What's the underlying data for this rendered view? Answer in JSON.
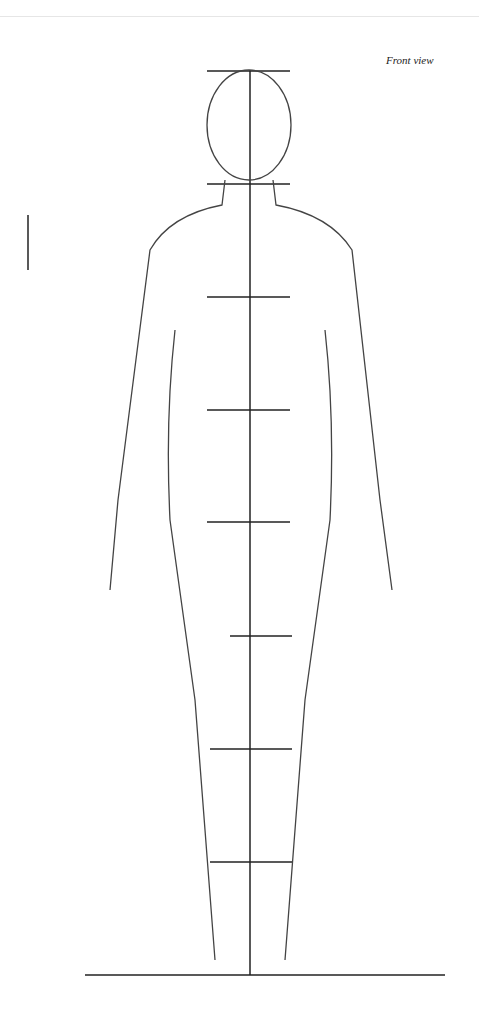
{
  "caption": "Front view",
  "diagram": {
    "type": "figure-proportion-guide",
    "measurement_marks_y": [
      71,
      184,
      297,
      410,
      522,
      636,
      749,
      862,
      975
    ],
    "head_units": 8
  }
}
